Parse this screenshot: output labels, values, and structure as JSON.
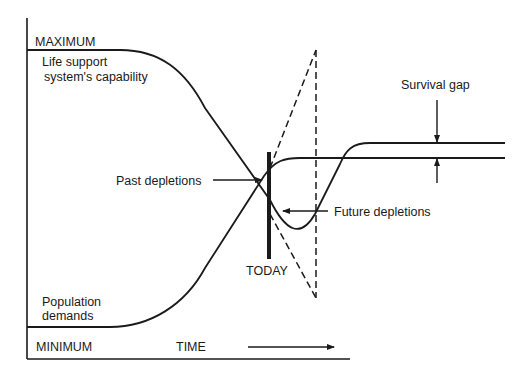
{
  "diagram": {
    "axis_top_label": "MAXIMUM",
    "axis_bottom_label": "MINIMUM",
    "time_label": "TIME",
    "capability_label_line1": "Life support",
    "capability_label_line2": "system's capability",
    "population_label_line1": "Population",
    "population_label_line2": "demands",
    "today_label": "TODAY",
    "past_depletions_label": "Past depletions",
    "future_depletions_label": "Future depletions",
    "survival_gap_label": "Survival gap",
    "line_color": "#1a1a1a"
  }
}
